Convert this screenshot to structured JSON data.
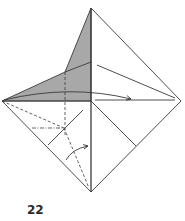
{
  "step": {
    "number": "22"
  },
  "colors": {
    "line": "#3a3a3a",
    "shaded": "#a8a8a8",
    "background": "#ffffff"
  },
  "diagram": {
    "vertices": {
      "top": [
        91,
        8
      ],
      "left": [
        2,
        101
      ],
      "right": [
        181,
        101
      ],
      "bottom": [
        91,
        192
      ]
    },
    "lines": {
      "mountain_fold": "dash-dot",
      "valley_fold": "dashed",
      "edge": "solid"
    },
    "arrows": [
      {
        "name": "fold-right-arrow",
        "direction": "right"
      },
      {
        "name": "fold-up-arrow",
        "direction": "up-right"
      }
    ]
  }
}
